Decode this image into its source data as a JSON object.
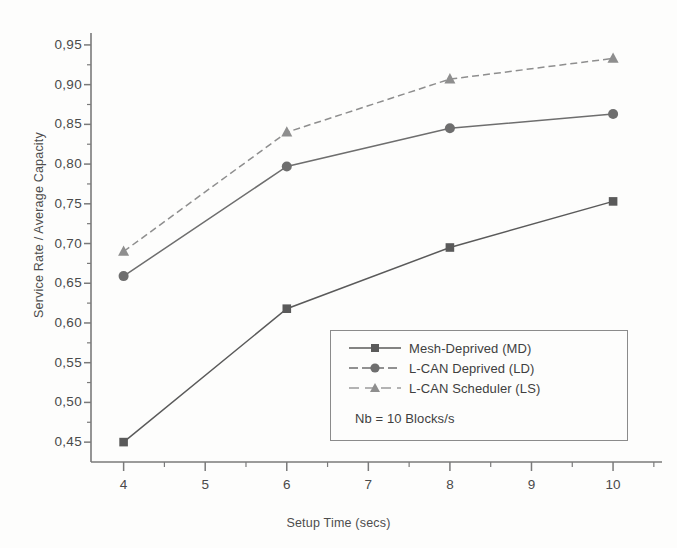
{
  "chart_data": {
    "type": "line",
    "title": "",
    "xlabel": "Setup Time (secs)",
    "ylabel": "Service Rate / Average Capacity",
    "x": [
      4,
      6,
      8,
      10
    ],
    "xlim": [
      3.6,
      10.6
    ],
    "ylim": [
      0.425,
      0.965
    ],
    "xticks": [
      4,
      5,
      6,
      7,
      8,
      9,
      10
    ],
    "xtick_labels": [
      "4",
      "5",
      "6",
      "7",
      "8",
      "9",
      "10"
    ],
    "yticks": [
      0.45,
      0.5,
      0.55,
      0.6,
      0.65,
      0.7,
      0.75,
      0.8,
      0.85,
      0.9,
      0.95
    ],
    "ytick_labels": [
      "0,45",
      "0,50",
      "0,55",
      "0,60",
      "0,65",
      "0,70",
      "0,75",
      "0,80",
      "0,85",
      "0,90",
      "0,95"
    ],
    "grid": false,
    "minor_ticks": true,
    "legend_position": "lower right",
    "annotations": [
      "Nb = 10 Blocks/s"
    ],
    "series": [
      {
        "name": "Mesh-Deprived (MD)",
        "marker": "square",
        "color": "#5a5a5a",
        "linestyle": "solid",
        "values": [
          0.45,
          0.618,
          0.695,
          0.753
        ]
      },
      {
        "name": "L-CAN Deprived (LD)",
        "marker": "circle",
        "color": "#6e6e6e",
        "linestyle": "solid",
        "values": [
          0.659,
          0.797,
          0.845,
          0.863
        ]
      },
      {
        "name": "L-CAN Scheduler (LS)",
        "marker": "triangle",
        "color": "#8e8e8e",
        "linestyle": "dashed",
        "values": [
          0.69,
          0.84,
          0.907,
          0.933
        ]
      }
    ]
  },
  "axes": {
    "ylabel": "Service Rate / Average Capacity",
    "xlabel": "Setup Time (secs)",
    "axis_color": "#7a7a7a"
  },
  "legend": {
    "entries": [
      {
        "label": "Mesh-Deprived (MD)"
      },
      {
        "label": "L-CAN Deprived (LD)"
      },
      {
        "label": "L-CAN Scheduler (LS)"
      }
    ],
    "note": "Nb = 10 Blocks/s"
  }
}
